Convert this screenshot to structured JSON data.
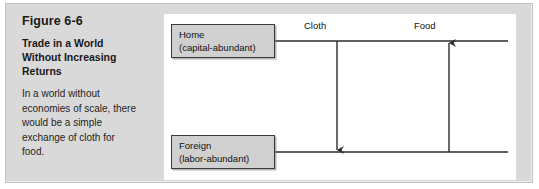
{
  "figure": {
    "number": "Figure 6-6",
    "title": "Trade in a World Without Increasing Returns",
    "body": "In a world without economies of scale, there would be a simple exchange of cloth for food."
  },
  "diagram": {
    "type": "trade-flow",
    "nodes": [
      {
        "id": "home",
        "name": "Home",
        "qualifier": "(capital-abundant)",
        "position": "top-left"
      },
      {
        "id": "foreign",
        "name": "Foreign",
        "qualifier": "(labor-abundant)",
        "position": "bottom-left"
      }
    ],
    "flows": [
      {
        "id": "cloth",
        "label": "Cloth",
        "from": "home",
        "to": "foreign",
        "direction": "down"
      },
      {
        "id": "food",
        "label": "Food",
        "from": "foreign",
        "to": "home",
        "direction": "up"
      }
    ]
  },
  "colors": {
    "panel_background": "#d9d9d9",
    "diagram_background": "#ffffff",
    "box_fill": "#d0d0d0",
    "box_border": "#3a3a3a",
    "line": "#2b2b2b",
    "text": "#1a1a1a"
  }
}
